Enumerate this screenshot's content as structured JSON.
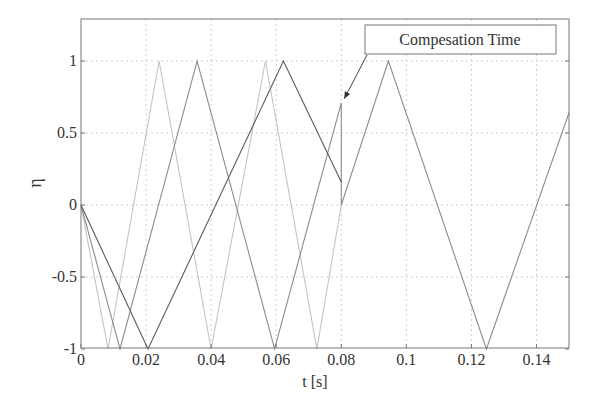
{
  "chart_data": {
    "type": "line",
    "title": "",
    "xlabel": "t [s]",
    "ylabel": "η",
    "xlim": [
      0,
      0.15
    ],
    "ylim": [
      -1,
      1.3
    ],
    "grid": true,
    "xticks": [
      0,
      0.02,
      0.04,
      0.06,
      0.08,
      0.1,
      0.12,
      0.14
    ],
    "xtick_labels": [
      "0",
      "0.02",
      "0.04",
      "0.06",
      "0.08",
      "0.1",
      "0.12",
      "0.14"
    ],
    "yticks": [
      -1,
      -0.5,
      0,
      0.5,
      1
    ],
    "ytick_labels": [
      "-1",
      "-0.5",
      "0",
      "0.5",
      "1"
    ],
    "legend": null,
    "series": [
      {
        "name": "carrier-light",
        "color": "#c4c4c4",
        "x": [
          0,
          0.0083,
          0.024,
          0.04,
          0.0567,
          0.0725,
          0.08
        ],
        "y": [
          0,
          -1,
          1,
          -1,
          1,
          -1,
          0
        ]
      },
      {
        "name": "carrier-medium",
        "color": "#8c8c8c",
        "x": [
          0,
          0.012,
          0.0357,
          0.0595,
          0.08,
          0.08,
          0.0945,
          0.1246,
          0.15
        ],
        "y": [
          0,
          -1,
          1,
          -1,
          0.71,
          0,
          1,
          -1,
          0.64
        ]
      },
      {
        "name": "carrier-dark",
        "color": "#5a5a5a",
        "x": [
          0,
          0.0206,
          0.0622,
          0.08
        ],
        "y": [
          0,
          -1,
          1,
          0.16
        ]
      }
    ],
    "annotations": [
      {
        "text": "Compesation Time",
        "box": true,
        "arrow_to": [
          0.08,
          0.71
        ]
      }
    ]
  },
  "labels": {
    "xlabel": "t [s]",
    "ylabel": "η",
    "annotation": "Compesation Time"
  }
}
